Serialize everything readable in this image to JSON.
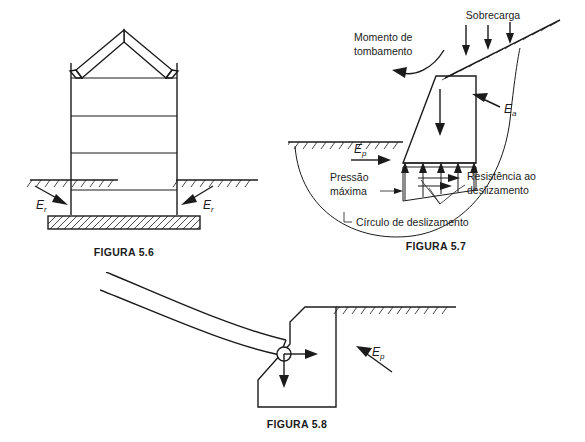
{
  "page": {
    "background_color": "#ffffff",
    "ink_color": "#1b1b1b",
    "caption_color": "#3c3c42",
    "width": 585,
    "height": 442
  },
  "figures": [
    {
      "id": "figura-5-6",
      "caption": "FIGURA 5.6",
      "subject": "building-on-foundation-slab-with-lateral-earth-pressure",
      "labels": {
        "left_force_symbol": "E",
        "left_force_subscript": "r",
        "right_force_symbol": "E",
        "right_force_subscript": "r"
      },
      "geometry_notes": {
        "storey_lines": 4,
        "roof": "gable",
        "foundation": "hatched-slab",
        "ground_line": "hatched-both-sides"
      }
    },
    {
      "id": "figura-5-7",
      "caption": "FIGURA 5.7",
      "subject": "gravity-retaining-wall-stability-forces",
      "labels": {
        "overturning_moment": "Momento de\ntombamento",
        "overturning_moment_line1": "Momento de",
        "overturning_moment_line2": "tombamento",
        "surcharge": "Sobrecarga",
        "active_pressure_symbol": "E",
        "active_pressure_subscript": "a",
        "passive_pressure_symbol": "E",
        "passive_pressure_subscript": "p",
        "max_pressure_line1": "Pressão",
        "max_pressure_line2": "máxima",
        "sliding_resistance_line1": "Resistência ao",
        "sliding_resistance_line2": "deslizamento",
        "slip_circle": "Círculo de deslizamento"
      },
      "geometry_notes": {
        "surcharge_arrows": 3,
        "base_uplift_arrows": 5,
        "base_friction_arrows": 3,
        "self_weight_arrow": 1,
        "slip_circle": "arc-through-backfill-and-base"
      }
    },
    {
      "id": "figura-5-8",
      "caption": "FIGURA 5.8",
      "subject": "arch-thrust-bearing-on-abutment-wall",
      "labels": {
        "passive_pressure_symbol": "E",
        "passive_pressure_subscript": "p"
      },
      "geometry_notes": {
        "arch": "curved-inclined-member",
        "bearing": "circular-pin",
        "thrust_arrows": [
          "horizontal-right",
          "vertical-down"
        ],
        "ground_line": "hatched-right-of-wall"
      }
    }
  ]
}
